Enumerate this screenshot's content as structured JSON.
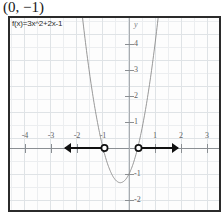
{
  "title": "(0, −1)",
  "chart_data": {
    "type": "line",
    "title": "(0, −1)",
    "function_label": "f(x)=3x^2+2x-1",
    "expression": "f(x) = 3x² + 2x − 1",
    "xlabel": "",
    "ylabel": "y",
    "y_axis_name": "y",
    "xlim": [
      -4.6,
      3.6
    ],
    "ylim": [
      -2.35,
      5.0
    ],
    "grid": true,
    "grid_minor_step": 0.5,
    "grid_major_step": 1,
    "legend": "none",
    "x_ticks": [
      -4,
      -3,
      -2,
      -1,
      1,
      2,
      3
    ],
    "x_tick_labels": [
      "-4",
      "-3",
      "-2",
      "-1",
      "1",
      "2",
      "3"
    ],
    "y_ticks": [
      4,
      3,
      2,
      1,
      -1,
      -2
    ],
    "y_tick_labels": [
      "4",
      "3",
      "2",
      "1",
      "-1",
      "-2"
    ],
    "curve_color": "#8c8c8c",
    "axis_color": "#8b8f93",
    "grid_color": "#e3e6e9",
    "overlay_color": "#111111",
    "roots": [
      -1,
      0.3333
    ],
    "vertex": [
      -0.3333,
      -1.3333
    ],
    "y_intercept": -1,
    "annotations": [
      {
        "name": "left-ray",
        "type": "open-ray",
        "endpoint_x": -1,
        "direction": "left",
        "arrow_to_x": -2.6,
        "y": 0,
        "open_circle": true
      },
      {
        "name": "right-ray",
        "type": "open-ray",
        "endpoint_x": 0.3333,
        "direction": "right",
        "arrow_to_x": 1.9,
        "y": 0,
        "open_circle": true
      }
    ],
    "series": [
      {
        "name": "f(x)=3x^2+2x-1",
        "x": [
          -1.45,
          -1.3,
          -1.2,
          -1.1,
          -1.0,
          -0.9,
          -0.8,
          -0.7,
          -0.6,
          -0.5,
          -0.4,
          -0.3333,
          -0.3,
          -0.2,
          -0.1,
          0.0,
          0.1,
          0.2,
          0.3333,
          0.4,
          0.5,
          0.6,
          0.7,
          0.8,
          0.9,
          1.0,
          1.1
        ],
        "y": [
          2.41,
          1.47,
          0.92,
          0.43,
          0.0,
          -0.37,
          -0.68,
          -0.93,
          -1.12,
          -1.25,
          -1.32,
          -1.3333,
          -1.33,
          -1.28,
          -1.17,
          -1.0,
          -0.77,
          -0.48,
          0.0,
          0.28,
          0.75,
          1.28,
          1.87,
          2.52,
          3.23,
          4.0,
          4.83
        ]
      }
    ]
  }
}
